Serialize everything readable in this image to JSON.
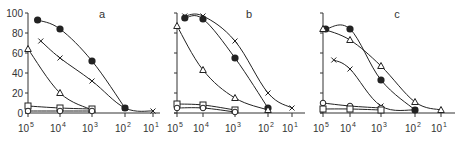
{
  "chart_data": [
    {
      "panel": "a",
      "type": "line",
      "title": "a",
      "xlabel": "",
      "ylabel": "",
      "x_scale": "log_reversed",
      "x_ticks": [
        "10^5",
        "10^4",
        "10^3",
        "10^2",
        "10^1"
      ],
      "y_ticks": [
        0,
        20,
        40,
        60,
        80,
        100
      ],
      "ylim": [
        0,
        100
      ],
      "grid": false,
      "series": [
        {
          "name": "filled-circle",
          "marker": "filled-circle",
          "points": [
            [
              4.7,
              93
            ],
            [
              4,
              84
            ],
            [
              3,
              52
            ],
            [
              2,
              5
            ]
          ]
        },
        {
          "name": "cross",
          "marker": "x",
          "points": [
            [
              4.6,
              72
            ],
            [
              4,
              55
            ],
            [
              3,
              32
            ],
            [
              2,
              5
            ],
            [
              1,
              2
            ]
          ]
        },
        {
          "name": "open-triangle",
          "marker": "triangle",
          "points": [
            [
              5,
              64
            ],
            [
              4,
              20
            ],
            [
              3,
              3
            ]
          ]
        },
        {
          "name": "open-square",
          "marker": "square",
          "points": [
            [
              5,
              7
            ],
            [
              4,
              5
            ],
            [
              3,
              4
            ]
          ]
        },
        {
          "name": "open-circle",
          "marker": "circle",
          "points": [
            [
              5,
              2
            ],
            [
              4,
              2
            ],
            [
              3,
              2
            ]
          ]
        }
      ]
    },
    {
      "panel": "b",
      "type": "line",
      "title": "b",
      "xlabel": "",
      "ylabel": "",
      "x_scale": "log_reversed",
      "x_ticks": [
        "10^5",
        "10^4",
        "10^3",
        "10^2",
        "10^1"
      ],
      "y_ticks": [
        0,
        20,
        40,
        60,
        80,
        100
      ],
      "ylim": [
        0,
        100
      ],
      "grid": false,
      "series": [
        {
          "name": "cross",
          "marker": "x",
          "points": [
            [
              4.7,
              97
            ],
            [
              4,
              97
            ],
            [
              3,
              72
            ],
            [
              2,
              20
            ],
            [
              1,
              5
            ]
          ]
        },
        {
          "name": "filled-circle",
          "marker": "filled-circle",
          "points": [
            [
              4.7,
              95
            ],
            [
              4,
              94
            ],
            [
              3,
              55
            ],
            [
              2,
              5
            ]
          ]
        },
        {
          "name": "open-triangle",
          "marker": "triangle",
          "points": [
            [
              5,
              87
            ],
            [
              4,
              43
            ],
            [
              3,
              15
            ],
            [
              2,
              3
            ]
          ]
        },
        {
          "name": "open-square",
          "marker": "square",
          "points": [
            [
              5,
              9
            ],
            [
              4,
              8
            ],
            [
              3,
              3
            ]
          ]
        },
        {
          "name": "open-circle",
          "marker": "circle",
          "points": [
            [
              5,
              5
            ],
            [
              4,
              5
            ],
            [
              3,
              1
            ]
          ]
        }
      ]
    },
    {
      "panel": "c",
      "type": "line",
      "title": "c",
      "xlabel": "",
      "ylabel": "",
      "x_scale": "log_reversed",
      "x_ticks": [
        "10^5",
        "10^4",
        "10^3",
        "10^2",
        "10^1"
      ],
      "y_ticks": [
        0,
        20,
        40,
        60,
        80,
        100
      ],
      "ylim": [
        0,
        100
      ],
      "grid": false,
      "series": [
        {
          "name": "filled-circle",
          "marker": "filled-circle",
          "points": [
            [
              4.9,
              84
            ],
            [
              4,
              84
            ],
            [
              3,
              33
            ],
            [
              2,
              3
            ]
          ]
        },
        {
          "name": "open-triangle",
          "marker": "triangle",
          "points": [
            [
              5,
              84
            ],
            [
              4,
              73
            ],
            [
              3,
              47
            ],
            [
              2,
              11
            ],
            [
              1,
              3
            ]
          ]
        },
        {
          "name": "cross",
          "marker": "x",
          "points": [
            [
              4.6,
              53
            ],
            [
              4,
              44
            ],
            [
              3,
              7
            ],
            [
              2,
              3
            ]
          ]
        },
        {
          "name": "open-circle",
          "marker": "circle",
          "points": [
            [
              5,
              10
            ],
            [
              4,
              7
            ],
            [
              3,
              5
            ]
          ]
        },
        {
          "name": "open-square",
          "marker": "square",
          "points": [
            [
              5,
              4
            ],
            [
              4,
              4
            ],
            [
              3,
              3
            ]
          ]
        }
      ]
    }
  ],
  "panels": [
    {
      "label": "a",
      "x_axis_px": [
        28,
        60,
        92,
        125,
        153
      ],
      "axis_left": 28,
      "axis_right": 160
    },
    {
      "label": "b",
      "x_axis_px": [
        177,
        203,
        235,
        268,
        292
      ],
      "axis_left": 177,
      "axis_right": 305
    },
    {
      "label": "c",
      "x_axis_px": [
        323,
        350,
        381,
        415,
        441
      ],
      "axis_left": 323,
      "axis_right": 455
    }
  ],
  "y_axis": {
    "ticks": [
      "0",
      "20",
      "40",
      "60",
      "80",
      "100"
    ],
    "top_px": 13,
    "bottom_px": 113
  },
  "x_tick_labels": [
    {
      "base": "10",
      "exp": "5"
    },
    {
      "base": "10",
      "exp": "4"
    },
    {
      "base": "10",
      "exp": "3"
    },
    {
      "base": "10",
      "exp": "2"
    },
    {
      "base": "10",
      "exp": "1"
    }
  ],
  "colors": {
    "line": "#222222",
    "axis": "#333333",
    "background": "#ffffff"
  }
}
